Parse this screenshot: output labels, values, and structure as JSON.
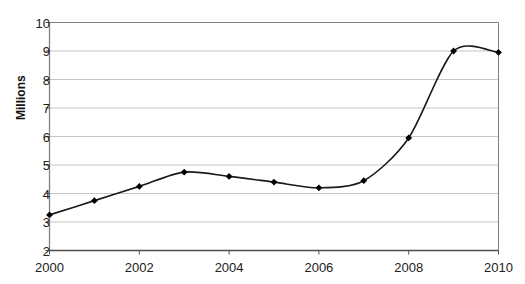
{
  "chart_data": {
    "type": "line",
    "title": "",
    "subtitle": "",
    "xlabel": "",
    "ylabel": "Millions",
    "x": [
      2000,
      2001,
      2002,
      2003,
      2004,
      2005,
      2006,
      2007,
      2008,
      2009,
      2010
    ],
    "categories": [
      "2000",
      "2001",
      "2002",
      "2003",
      "2004",
      "2005",
      "2006",
      "2007",
      "2008",
      "2009",
      "2010"
    ],
    "values": [
      3.25,
      3.75,
      4.25,
      4.75,
      4.6,
      4.4,
      4.2,
      4.45,
      5.95,
      9.0,
      8.95
    ],
    "series": [
      {
        "name": "",
        "values": [
          3.25,
          3.75,
          4.25,
          4.75,
          4.6,
          4.4,
          4.2,
          4.45,
          5.95,
          9.0,
          8.95
        ]
      }
    ],
    "ylim": [
      2,
      10
    ],
    "xlim": [
      2000,
      2010
    ],
    "ytick_labels": [
      "10",
      "9",
      "8",
      "7",
      "6",
      "5",
      "4",
      "3",
      "2"
    ],
    "ytick_values": [
      10,
      9,
      8,
      7,
      6,
      5,
      4,
      3,
      2
    ],
    "xtick_labels": [
      "2000",
      "2002",
      "2004",
      "2006",
      "2008",
      "2010"
    ],
    "xtick_values": [
      2000,
      2002,
      2004,
      2006,
      2008,
      2010
    ],
    "grid": "horizontal",
    "legend": "none",
    "marker": "diamond",
    "line_color": "#1a1a1a",
    "marker_color": "#000000",
    "grid_color": "#c6c6c6",
    "axis_color": "#808080",
    "background": "#ffffff",
    "smoothing": true
  }
}
